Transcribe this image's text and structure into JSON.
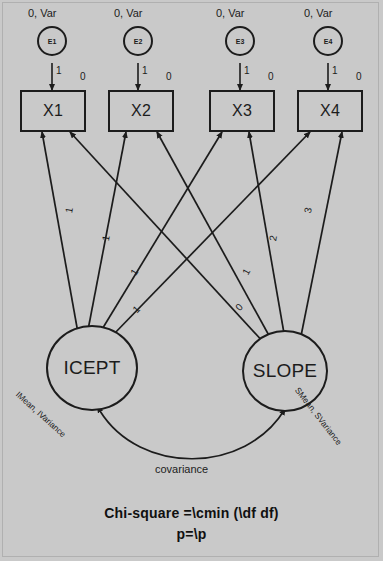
{
  "diagram": {
    "background_color": "#c9c9c9",
    "line_color": "#1c1c1c",
    "errors": [
      {
        "id": "E1",
        "label": "E1",
        "param": "0, Var",
        "path_label": "1"
      },
      {
        "id": "E2",
        "label": "E2",
        "param": "0, Var",
        "path_label": "1"
      },
      {
        "id": "E3",
        "label": "E3",
        "param": "0, Var",
        "path_label": "1"
      },
      {
        "id": "E4",
        "label": "E4",
        "param": "0, Var",
        "path_label": "1"
      }
    ],
    "observed": [
      {
        "id": "X1",
        "label": "X1",
        "intercept": "0"
      },
      {
        "id": "X2",
        "label": "X2",
        "intercept": "0"
      },
      {
        "id": "X3",
        "label": "X3",
        "intercept": "0"
      },
      {
        "id": "X4",
        "label": "X4",
        "intercept": "0"
      }
    ],
    "latents": [
      {
        "id": "ICEPT",
        "label": "ICEPT",
        "param": "IMean, IVariance"
      },
      {
        "id": "SLOPE",
        "label": "SLOPE",
        "param": "SMean, SVariance"
      }
    ],
    "loadings": {
      "icept": [
        {
          "target": "X1",
          "value": "1"
        },
        {
          "target": "X2",
          "value": "1"
        },
        {
          "target": "X3",
          "value": "1"
        },
        {
          "target": "X4",
          "value": "1"
        }
      ],
      "slope": [
        {
          "target": "X1",
          "value": "0"
        },
        {
          "target": "X2",
          "value": "1"
        },
        {
          "target": "X3",
          "value": "2"
        },
        {
          "target": "X4",
          "value": "3"
        }
      ]
    },
    "covariance": {
      "label": "covariance"
    },
    "fit": {
      "line1": "Chi-square =\\cmin (\\df df)",
      "line2": "p=\\p"
    }
  }
}
